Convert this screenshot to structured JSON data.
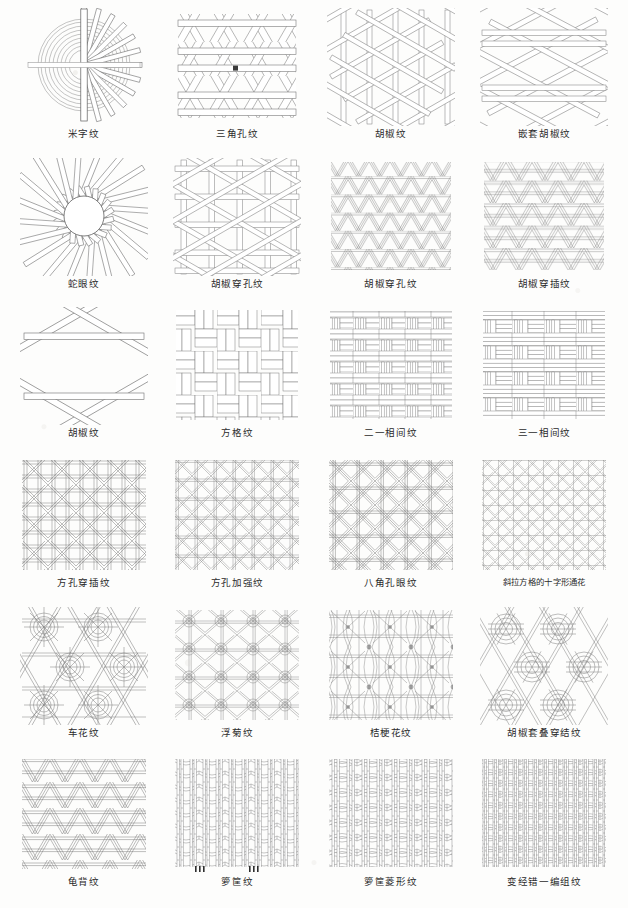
{
  "page": {
    "background_color": "#fdfdfc",
    "ink_color": "#4a4a4a",
    "caption_color": "#2b2b2b",
    "columns": 4,
    "rows": 6
  },
  "patterns": [
    {
      "id": "mi-zi-wen",
      "label": "米字纹",
      "type": "radial-star",
      "row": 1,
      "col": 1
    },
    {
      "id": "san-jiao-kong",
      "label": "三角孔纹",
      "type": "triangle-hole",
      "row": 1,
      "col": 2
    },
    {
      "id": "hu-jiao-wen-1",
      "label": "胡椒纹",
      "type": "pepper-hex",
      "row": 1,
      "col": 3
    },
    {
      "id": "qiantao-hujiao",
      "label": "嵌套胡椒纹",
      "type": "nested-pepper",
      "row": 1,
      "col": 4
    },
    {
      "id": "she-yan-wen",
      "label": "蛇眼纹",
      "type": "snake-eye",
      "row": 2,
      "col": 1
    },
    {
      "id": "hujiao-chuankong-1",
      "label": "胡椒穿孔纹",
      "type": "pepper-pierced-a",
      "row": 2,
      "col": 2
    },
    {
      "id": "hujiao-chuankong-2",
      "label": "胡椒穿孔纹",
      "type": "pepper-pierced-b",
      "row": 2,
      "col": 3
    },
    {
      "id": "hujiao-chuancha",
      "label": "胡椒穿插纹",
      "type": "pepper-interlace",
      "row": 2,
      "col": 4
    },
    {
      "id": "hu-jiao-wen-2",
      "label": "胡椒纹",
      "type": "pepper-open",
      "row": 3,
      "col": 1
    },
    {
      "id": "fang-ge-wen",
      "label": "方格纹",
      "type": "basket-square",
      "row": 3,
      "col": 2
    },
    {
      "id": "er-yi-xiangjian",
      "label": "二一相间纹",
      "type": "basket-2-1",
      "row": 3,
      "col": 3
    },
    {
      "id": "san-yi-xiangjian",
      "label": "三一相间纹",
      "type": "basket-3-1",
      "row": 3,
      "col": 4
    },
    {
      "id": "fangkong-chuancha",
      "label": "方孔穿插纹",
      "type": "square-hole-interlace",
      "row": 4,
      "col": 1
    },
    {
      "id": "fangkong-jiaqiang",
      "label": "方孔加强纹",
      "type": "square-hole-reinforced",
      "row": 4,
      "col": 2
    },
    {
      "id": "bajiao-kongyan",
      "label": "八角孔眼纹",
      "type": "octagon-eye",
      "row": 4,
      "col": 3
    },
    {
      "id": "xiela-shizi",
      "label": "斜拉方格的十字形通花",
      "type": "diagonal-cross-openwork",
      "row": 4,
      "col": 4
    },
    {
      "id": "che-hua-wen",
      "label": "车花纹",
      "type": "wheel-flower",
      "row": 5,
      "col": 1
    },
    {
      "id": "fu-ju-wen",
      "label": "浮菊纹",
      "type": "floating-chrysanthemum",
      "row": 5,
      "col": 2
    },
    {
      "id": "jiegeng-hua",
      "label": "桔梗花纹",
      "type": "bellflower",
      "row": 5,
      "col": 3
    },
    {
      "id": "hujiao-taodie",
      "label": "胡椒套叠穿结纹",
      "type": "pepper-stacked-knot",
      "row": 5,
      "col": 4
    },
    {
      "id": "gui-bei-wen",
      "label": "龟背纹",
      "type": "tortoise-shell",
      "row": 6,
      "col": 1
    },
    {
      "id": "luo-kuang-wen",
      "label": "箩筐纹",
      "type": "wicker-basket",
      "row": 6,
      "col": 2
    },
    {
      "id": "luokuang-lingxing",
      "label": "箩筐菱形纹",
      "type": "wicker-diamond",
      "row": 6,
      "col": 3
    },
    {
      "id": "bianjing-cuoyi",
      "label": "变经错一编组纹",
      "type": "shifted-warp-weave",
      "row": 6,
      "col": 4
    }
  ]
}
